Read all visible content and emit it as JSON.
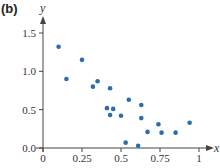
{
  "panel_label": "(b)",
  "colors": {
    "point": "#2e6bb0",
    "axis": "#444444"
  },
  "chart_data": {
    "type": "scatter",
    "title": "",
    "xlabel": "x",
    "ylabel": "y",
    "xlim": [
      0,
      1
    ],
    "ylim": [
      0,
      1.5
    ],
    "grid": false,
    "legend": null,
    "x_ticks": [
      0,
      0.25,
      0.5,
      0.75,
      1
    ],
    "x_tick_labels": [
      "0",
      "0.25",
      "0.5",
      "0.75",
      "1"
    ],
    "y_ticks": [
      0,
      0.5,
      1.0,
      1.5
    ],
    "y_tick_labels": [
      "0.0",
      "0.5",
      "1.0",
      "1.5"
    ],
    "series": [
      {
        "name": "data",
        "points": [
          {
            "x": 0.1,
            "y": 1.32
          },
          {
            "x": 0.15,
            "y": 0.9
          },
          {
            "x": 0.25,
            "y": 1.15
          },
          {
            "x": 0.32,
            "y": 0.8
          },
          {
            "x": 0.35,
            "y": 0.87
          },
          {
            "x": 0.43,
            "y": 0.78
          },
          {
            "x": 0.41,
            "y": 0.52
          },
          {
            "x": 0.45,
            "y": 0.51
          },
          {
            "x": 0.43,
            "y": 0.43
          },
          {
            "x": 0.5,
            "y": 0.42
          },
          {
            "x": 0.55,
            "y": 0.63
          },
          {
            "x": 0.63,
            "y": 0.56
          },
          {
            "x": 0.63,
            "y": 0.39
          },
          {
            "x": 0.67,
            "y": 0.21
          },
          {
            "x": 0.74,
            "y": 0.31
          },
          {
            "x": 0.76,
            "y": 0.2
          },
          {
            "x": 0.85,
            "y": 0.2
          },
          {
            "x": 0.94,
            "y": 0.33
          },
          {
            "x": 0.53,
            "y": 0.07
          },
          {
            "x": 0.61,
            "y": 0.03
          }
        ]
      }
    ]
  }
}
